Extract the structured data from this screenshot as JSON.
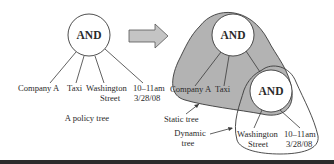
{
  "left_tree": {
    "root_label": "AND",
    "leaves": [
      {
        "line1": "Company A",
        "line2": ""
      },
      {
        "line1": "Taxi",
        "line2": ""
      },
      {
        "line1": "Washington",
        "line2": "Street"
      },
      {
        "line1": "10–11am",
        "line2": "3/28/08"
      }
    ],
    "caption": "A policy tree"
  },
  "right_tree": {
    "root_label": "AND",
    "sub_root_label": "AND",
    "static_leaves": [
      "Company A",
      "Taxi"
    ],
    "dynamic_leaves": [
      {
        "line1": "Washington",
        "line2": "Street"
      },
      {
        "line1": "10–11am",
        "line2": "3/28/08"
      }
    ],
    "static_label": "Static tree",
    "dynamic_label_line1": "Dynamic",
    "dynamic_label_line2": "tree"
  },
  "colors": {
    "static_region_fill": "#b3b3b3",
    "arrow_fill": "#c4c4c4",
    "stroke": "#3a3a3a"
  }
}
